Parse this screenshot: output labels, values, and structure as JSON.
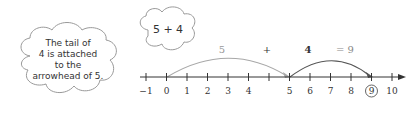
{
  "bubble_note": {
    "lines": [
      "The tail of",
      "4 is attached",
      "to the",
      "arrowhead of 5."
    ]
  },
  "bubble_expr": {
    "text": "5 + 4"
  },
  "equation": {
    "first": "5",
    "plus": "+",
    "second": "4",
    "result": "= 9"
  },
  "number_line": {
    "ticks": [
      "−1",
      "0",
      "1",
      "2",
      "3",
      "4",
      "5",
      "6",
      "7",
      "8",
      "9",
      "10"
    ],
    "circled": "9"
  },
  "colors": {
    "jump_first": "#a8a8a8",
    "jump_second": "#555555",
    "axis": "#333333",
    "text": "#333333"
  }
}
